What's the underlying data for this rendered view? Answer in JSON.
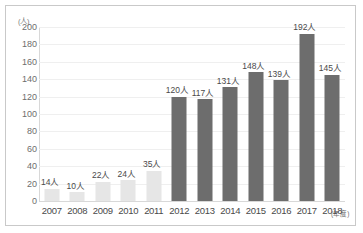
{
  "chart_data": {
    "type": "bar",
    "title": "",
    "subtitle": "",
    "xlabel": "(年度)",
    "ylabel": "(人)",
    "ylim": [
      0,
      200
    ],
    "ytick_step": 20,
    "yticks": [
      200,
      180,
      160,
      140,
      120,
      100,
      80,
      60,
      40,
      20,
      0
    ],
    "grid": true,
    "legend": "none",
    "categories": [
      "2007",
      "2008",
      "2009",
      "2010",
      "2011",
      "2012",
      "2013",
      "2014",
      "2015",
      "2016",
      "2017",
      "2018"
    ],
    "values": [
      14,
      10,
      22,
      24,
      35,
      120,
      117,
      131,
      148,
      139,
      192,
      145
    ],
    "data_labels": [
      "14人",
      "10人",
      "22人",
      "24人",
      "35人",
      "120人",
      "117人",
      "131人",
      "148人",
      "139人",
      "192人",
      "145人"
    ],
    "bar_styles": [
      "light",
      "light",
      "light",
      "light",
      "light",
      "dark",
      "dark",
      "dark",
      "dark",
      "dark",
      "dark",
      "dark"
    ],
    "colors": {
      "bar_light": "#e6e6e6",
      "bar_dark": "#6d6d6d",
      "gridline": "#efefef",
      "axis": "#d8d8d8",
      "frame": "#c9c9c9",
      "tick_text": "#6e6e6e",
      "label_text": "#4a4a4a",
      "background": "#ffffff"
    }
  }
}
